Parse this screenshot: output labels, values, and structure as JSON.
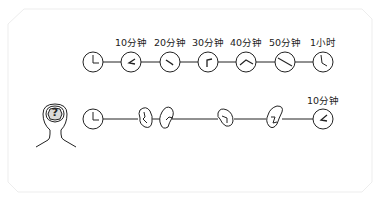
{
  "diagram": {
    "top_row": {
      "labels": [
        "10分钟",
        "20分钟",
        "30分钟",
        "40分钟",
        "50分钟",
        "1小时"
      ],
      "clock_count": 7
    },
    "bottom_row": {
      "head_symbol": "?",
      "end_label": "10分钟",
      "broken_clock_count": 4
    }
  },
  "colors": {
    "stroke": "#222222",
    "card_border": "#eeeeee",
    "head_fill": "#d9d9d9"
  }
}
